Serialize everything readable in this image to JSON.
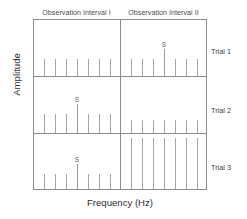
{
  "figure": {
    "xlabel": "Frequency (Hz)",
    "ylabel": "Amplitude",
    "intervals": [
      {
        "id": "interval-1",
        "label": "Observation Interval I"
      },
      {
        "id": "interval-2",
        "label": "Observation Interval II"
      }
    ],
    "trial_labels": [
      {
        "id": "trial-1",
        "label": "Trial 1"
      },
      {
        "id": "trial-2",
        "label": "Trial 2"
      },
      {
        "id": "trial-3",
        "label": "Trial 3"
      }
    ],
    "signal_marker": "S",
    "colors": {
      "frame": "#8d8d8d",
      "spike": "#a6a6a6",
      "signal_spike": "#9a9a9a",
      "text": "#3a3a3a",
      "background": "#ffffff"
    }
  },
  "chart_data": {
    "type": "bar",
    "title": "",
    "xlabel": "Frequency (Hz)",
    "ylabel": "Amplitude",
    "grid": false,
    "legend": "none",
    "axis_ranges": {
      "x": "frequency (arbitrary, unlabeled)",
      "y": "amplitude (arbitrary, unlabeled)"
    },
    "panels": [
      {
        "trial": "Trial 1",
        "intervals": [
          {
            "name": "Observation Interval I",
            "signal_present": false,
            "signal_index": null,
            "x": [
              10,
              21,
              32,
              43,
              54,
              65,
              76
            ],
            "values": [
              30,
              30,
              30,
              30,
              30,
              30,
              30
            ]
          },
          {
            "name": "Observation Interval II",
            "signal_present": true,
            "signal_index": 3,
            "signal_label": "S",
            "x": [
              10,
              21,
              32,
              43,
              54,
              65,
              76
            ],
            "values": [
              30,
              30,
              30,
              48,
              30,
              30,
              30
            ]
          }
        ]
      },
      {
        "trial": "Trial 2",
        "intervals": [
          {
            "name": "Observation Interval I",
            "signal_present": true,
            "signal_index": 3,
            "signal_label": "S",
            "x": [
              10,
              21,
              32,
              43,
              54,
              65,
              76
            ],
            "values": [
              34,
              34,
              34,
              52,
              34,
              34,
              34
            ]
          },
          {
            "name": "Observation Interval II",
            "signal_present": false,
            "signal_index": null,
            "x": [
              10,
              21,
              32,
              43,
              54,
              65,
              76
            ],
            "values": [
              24,
              24,
              24,
              24,
              24,
              24,
              24
            ]
          }
        ]
      },
      {
        "trial": "Trial 3",
        "intervals": [
          {
            "name": "Observation Interval I",
            "signal_present": true,
            "signal_index": 3,
            "signal_label": "S",
            "x": [
              10,
              21,
              32,
              43,
              54,
              65,
              76
            ],
            "values": [
              28,
              28,
              28,
              46,
              28,
              28,
              28
            ]
          },
          {
            "name": "Observation Interval II",
            "signal_present": false,
            "signal_index": null,
            "x": [
              10,
              21,
              32,
              43,
              54,
              65,
              76
            ],
            "values": [
              92,
              92,
              92,
              92,
              92,
              92,
              92
            ]
          }
        ]
      }
    ]
  }
}
